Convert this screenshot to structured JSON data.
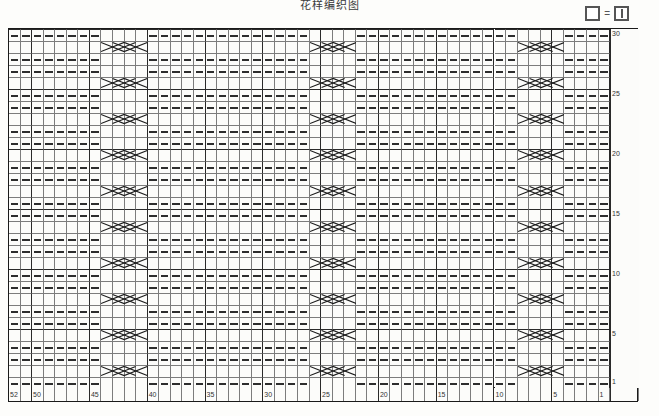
{
  "title": "花样编织图",
  "legend": {
    "blank_symbol": "blank-square",
    "equals": "=",
    "purl_symbol": "square-with-vertical-bar"
  },
  "chart_data": {
    "type": "table",
    "title": "花样编织图",
    "chart_kind": "knitting-stitch-chart",
    "columns": 52,
    "rows": 30,
    "column_numbering_direction": "right-to-left",
    "row_numbering_direction": "bottom-to-top",
    "column_tick_labels": [
      1,
      5,
      10,
      15,
      20,
      25,
      30,
      35,
      40,
      45,
      50,
      52
    ],
    "row_tick_labels": [
      1,
      5,
      10,
      15,
      20,
      25,
      30
    ],
    "grid": true,
    "heavy_gridline_interval": 5,
    "symbols": {
      "dash": "knit-stitch-dash",
      "blank": "purl-stitch-blank",
      "cable": "cable-cross-4st"
    },
    "cable_columns_1based_from_left": [
      [
        9,
        12
      ],
      [
        27,
        30
      ],
      [
        45,
        48
      ]
    ],
    "cable_rows_1based_from_bottom": [
      2,
      5,
      8,
      11,
      14,
      17,
      20,
      23,
      26,
      29
    ],
    "dash_rows_1based_from_bottom": [
      1,
      3,
      4,
      6,
      7,
      9,
      10,
      12,
      13,
      15,
      16,
      18,
      19,
      21,
      22,
      24,
      25,
      27,
      28,
      30
    ]
  }
}
